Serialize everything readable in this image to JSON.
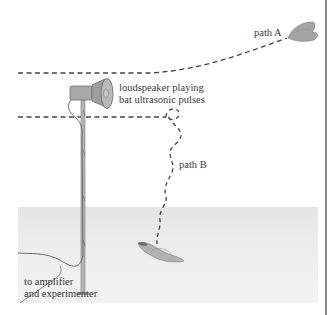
{
  "labels": {
    "path_a": "path A",
    "speaker_line1": "loudspeaker playing",
    "speaker_line2": "bat ultrasonic pulses",
    "path_b": "path B",
    "amp_line1": "to amplifier",
    "amp_line2": "and experimenter"
  },
  "colors": {
    "dash": "#444444",
    "ground": "#e8e8e8",
    "border": "#8a8a8a",
    "speaker": "#9a9a9a",
    "moth": "#8c8c8c"
  }
}
